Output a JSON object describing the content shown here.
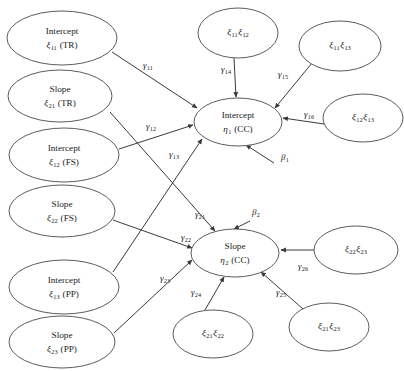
{
  "figure": {
    "type": "path-diagram",
    "width": 404,
    "height": 371,
    "background": "#ffffff",
    "stroke_color": "#4a4a4a",
    "text_color": "#1a1a1a"
  },
  "nodes": {
    "exogenous": [
      {
        "id": "x_int_tr",
        "line1": "Intercept",
        "symbol": "ξ",
        "sub": "11",
        "suffix": " (TR)",
        "cx": 62,
        "cy": 38,
        "rx": 55,
        "ry": 27
      },
      {
        "id": "x_slp_tr",
        "line1": "Slope",
        "symbol": "ξ",
        "sub": "21",
        "suffix": " (TR)",
        "cx": 60,
        "cy": 96,
        "rx": 52,
        "ry": 26
      },
      {
        "id": "x_int_fs",
        "line1": "Intercept",
        "symbol": "ξ",
        "sub": "12",
        "suffix": " (FS)",
        "cx": 64,
        "cy": 155,
        "rx": 55,
        "ry": 27
      },
      {
        "id": "x_slp_fs",
        "line1": "Slope",
        "symbol": "ξ",
        "sub": "22",
        "suffix": " (FS)",
        "cx": 62,
        "cy": 211,
        "rx": 53,
        "ry": 26
      },
      {
        "id": "x_int_pp",
        "line1": "Intercept",
        "symbol": "ξ",
        "sub": "13",
        "suffix": " (PP)",
        "cx": 64,
        "cy": 287,
        "rx": 55,
        "ry": 27
      },
      {
        "id": "x_slp_pp",
        "line1": "Slope",
        "symbol": "ξ",
        "sub": "23",
        "suffix": " (PP)",
        "cx": 62,
        "cy": 342,
        "rx": 53,
        "ry": 26
      }
    ],
    "interactions": [
      {
        "id": "ix_11_12",
        "a_sym": "ξ",
        "a_sub": "11",
        "b_sym": "ξ",
        "b_sub": "12",
        "cx": 238,
        "cy": 33,
        "rx": 40,
        "ry": 25
      },
      {
        "id": "ix_11_13",
        "a_sym": "ξ",
        "a_sub": "11",
        "b_sym": "ξ",
        "b_sub": "13",
        "cx": 340,
        "cy": 46,
        "rx": 41,
        "ry": 25
      },
      {
        "id": "ix_12_13",
        "a_sym": "ξ",
        "a_sub": "12",
        "b_sym": "ξ",
        "b_sub": "13",
        "cx": 363,
        "cy": 118,
        "rx": 40,
        "ry": 24
      },
      {
        "id": "ix_22_23",
        "a_sym": "ξ",
        "a_sub": "22",
        "b_sym": "ξ",
        "b_sub": "23",
        "cx": 356,
        "cy": 250,
        "rx": 42,
        "ry": 24
      },
      {
        "id": "ix_21_22",
        "a_sym": "ξ",
        "a_sub": "21",
        "b_sym": "ξ",
        "b_sub": "22",
        "cx": 213,
        "cy": 334,
        "rx": 40,
        "ry": 24
      },
      {
        "id": "ix_21_23",
        "a_sym": "ξ",
        "a_sub": "21",
        "b_sym": "ξ",
        "b_sub": "23",
        "cx": 329,
        "cy": 327,
        "rx": 40,
        "ry": 24
      }
    ],
    "endogenous": [
      {
        "id": "eta1",
        "line1": "Intercept",
        "symbol": "η",
        "sub": "1",
        "suffix": " (CC)",
        "cx": 238,
        "cy": 122,
        "rx": 44,
        "ry": 24
      },
      {
        "id": "eta2",
        "line1": "Slope",
        "symbol": "η",
        "sub": "2",
        "suffix": " (CC)",
        "cx": 235,
        "cy": 253,
        "rx": 44,
        "ry": 24
      }
    ]
  },
  "edges": [
    {
      "id": "e_g11",
      "from": "x_int_tr",
      "to": "eta1",
      "label_sym": "γ",
      "label_sub": "11",
      "lx": 148,
      "ly": 66,
      "x1": 112,
      "y1": 52,
      "x2": 197,
      "y2": 108
    },
    {
      "id": "e_g12",
      "from": "x_int_fs",
      "to": "eta1",
      "label_sym": "γ",
      "label_sub": "12",
      "lx": 151,
      "ly": 127,
      "x1": 119,
      "y1": 149,
      "x2": 193,
      "y2": 125
    },
    {
      "id": "e_g13",
      "from": "x_int_pp",
      "to": "eta1",
      "label_sym": "γ",
      "label_sub": "13",
      "lx": 174,
      "ly": 155,
      "x1": 113,
      "y1": 272,
      "x2": 202,
      "y2": 139
    },
    {
      "id": "e_g14",
      "from": "ix_11_12",
      "to": "eta1",
      "label_sym": "γ",
      "label_sub": "14",
      "lx": 226,
      "ly": 70,
      "x1": 234,
      "y1": 58,
      "x2": 236,
      "y2": 97
    },
    {
      "id": "e_g15",
      "from": "ix_11_13",
      "to": "eta1",
      "label_sym": "γ",
      "label_sub": "15",
      "lx": 283,
      "ly": 75,
      "x1": 312,
      "y1": 63,
      "x2": 275,
      "y2": 108
    },
    {
      "id": "e_g16",
      "from": "ix_12_13",
      "to": "eta1",
      "label_sym": "γ",
      "label_sub": "16",
      "lx": 309,
      "ly": 115,
      "x1": 324,
      "y1": 124,
      "x2": 283,
      "y2": 118
    },
    {
      "id": "e_b1",
      "from": "disturbance1",
      "to": "eta1",
      "label_sym": "β",
      "label_sub": "1",
      "lx": 285,
      "ly": 158,
      "x1": 274,
      "y1": 163,
      "x2": 246,
      "y2": 145
    },
    {
      "id": "e_g21",
      "from": "x_slp_tr",
      "to": "eta2",
      "label_sym": "γ",
      "label_sub": "21",
      "lx": 200,
      "ly": 215,
      "x1": 110,
      "y1": 112,
      "x2": 215,
      "y2": 231
    },
    {
      "id": "e_g22",
      "from": "x_slp_fs",
      "to": "eta2",
      "label_sym": "γ",
      "label_sub": "22",
      "lx": 186,
      "ly": 238,
      "x1": 113,
      "y1": 220,
      "x2": 192,
      "y2": 248
    },
    {
      "id": "e_g23",
      "from": "x_slp_pp",
      "to": "eta2",
      "label_sym": "γ",
      "label_sub": "23",
      "lx": 165,
      "ly": 279,
      "x1": 114,
      "y1": 333,
      "x2": 192,
      "y2": 260
    },
    {
      "id": "e_b2",
      "from": "disturbance2",
      "to": "eta2",
      "label_sym": "β",
      "label_sub": "2",
      "lx": 256,
      "ly": 213,
      "x1": 250,
      "y1": 221,
      "x2": 234,
      "y2": 229
    },
    {
      "id": "e_g24",
      "from": "ix_21_22",
      "to": "eta2",
      "label_sym": "γ",
      "label_sub": "24",
      "lx": 196,
      "ly": 293,
      "x1": 205,
      "y1": 310,
      "x2": 224,
      "y2": 277
    },
    {
      "id": "e_g25",
      "from": "ix_21_23",
      "to": "eta2",
      "label_sym": "γ",
      "label_sub": "25",
      "lx": 281,
      "ly": 293,
      "x1": 303,
      "y1": 309,
      "x2": 261,
      "y2": 272
    },
    {
      "id": "e_g26",
      "from": "ix_22_23",
      "to": "eta2",
      "label_sym": "γ",
      "label_sub": "26",
      "lx": 303,
      "ly": 267,
      "x1": 314,
      "y1": 250,
      "x2": 281,
      "y2": 250
    }
  ]
}
